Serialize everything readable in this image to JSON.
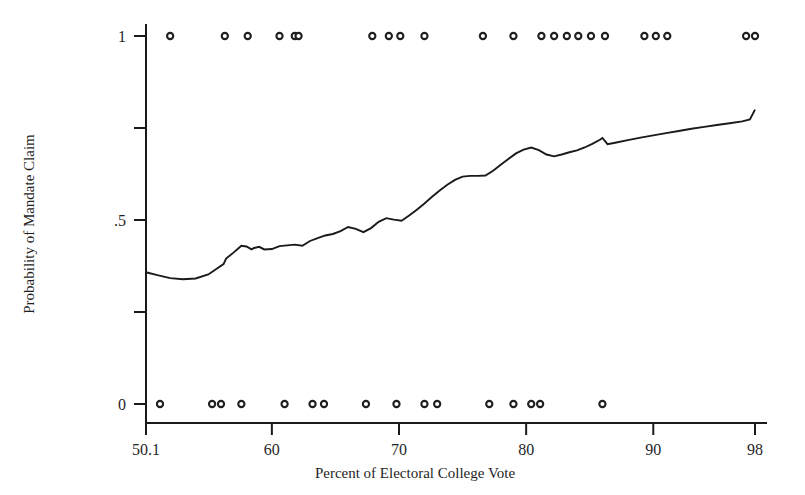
{
  "chart_data": {
    "type": "line",
    "title": "",
    "xlabel": "Percent of Electoral College Vote",
    "ylabel": "Probability of Mandate Claim",
    "xlim": [
      50.1,
      98
    ],
    "ylim": [
      0,
      1
    ],
    "grid": false,
    "legend": null,
    "x_ticks": [
      50.1,
      60,
      70,
      80,
      90,
      98
    ],
    "x_tick_labels": [
      "50.1",
      "60",
      "70",
      "80",
      "90",
      "98"
    ],
    "y_ticks": [
      0,
      0.25,
      0.5,
      0.75,
      1
    ],
    "y_tick_labels": [
      "0",
      "",
      ".5",
      "",
      "1"
    ],
    "series": [
      {
        "name": "Predicted probability of mandate claim",
        "type": "line",
        "x": [
          50.1,
          51.0,
          52.0,
          53.0,
          54.0,
          55.0,
          55.6,
          56.2,
          56.4,
          57.0,
          57.4,
          57.6,
          58.0,
          58.4,
          58.6,
          59.0,
          59.4,
          60.0,
          60.6,
          61.2,
          61.8,
          62.4,
          63.0,
          63.6,
          64.2,
          64.8,
          65.4,
          66.0,
          66.6,
          67.2,
          67.8,
          68.4,
          69.0,
          69.6,
          70.2,
          70.8,
          71.4,
          72.0,
          72.6,
          73.2,
          73.8,
          74.4,
          75.0,
          75.6,
          76.2,
          76.8,
          77.4,
          78.0,
          78.6,
          79.2,
          79.8,
          80.4,
          81.0,
          81.6,
          82.2,
          82.8,
          83.4,
          84.0,
          84.6,
          85.2,
          85.8,
          86.0,
          86.4,
          87.0,
          88.0,
          89.0,
          90.0,
          91.0,
          92.0,
          93.0,
          94.0,
          95.0,
          96.0,
          97.0,
          97.6,
          98.0
        ],
        "y": [
          0.358,
          0.35,
          0.342,
          0.339,
          0.341,
          0.352,
          0.366,
          0.38,
          0.395,
          0.412,
          0.424,
          0.43,
          0.428,
          0.42,
          0.424,
          0.427,
          0.42,
          0.421,
          0.429,
          0.431,
          0.433,
          0.43,
          0.443,
          0.451,
          0.458,
          0.462,
          0.47,
          0.481,
          0.476,
          0.467,
          0.478,
          0.495,
          0.505,
          0.501,
          0.498,
          0.512,
          0.528,
          0.545,
          0.563,
          0.58,
          0.596,
          0.609,
          0.618,
          0.62,
          0.62,
          0.621,
          0.634,
          0.65,
          0.666,
          0.681,
          0.691,
          0.697,
          0.69,
          0.678,
          0.673,
          0.678,
          0.684,
          0.689,
          0.697,
          0.707,
          0.718,
          0.723,
          0.706,
          0.71,
          0.717,
          0.724,
          0.73,
          0.736,
          0.742,
          0.748,
          0.753,
          0.758,
          0.763,
          0.768,
          0.773,
          0.8
        ]
      },
      {
        "name": "Observed outcomes: mandate claimed",
        "type": "scatter",
        "marker": "open-circle",
        "y_value": 1,
        "x": [
          52.0,
          56.3,
          58.1,
          60.6,
          61.8,
          62.1,
          67.9,
          69.2,
          70.1,
          72.0,
          76.6,
          79.0,
          81.2,
          82.2,
          83.2,
          84.1,
          85.1,
          86.2,
          89.3,
          90.2,
          91.1,
          97.3,
          98.0
        ]
      },
      {
        "name": "Observed outcomes: no mandate claimed",
        "type": "scatter",
        "marker": "open-circle",
        "y_value": 0,
        "x": [
          51.2,
          55.3,
          56.0,
          57.6,
          61.0,
          63.2,
          64.1,
          67.4,
          69.8,
          72.0,
          73.0,
          77.1,
          79.0,
          80.4,
          81.1,
          86.0
        ]
      }
    ]
  },
  "figure": {
    "background_color": "#ffffff",
    "line_color": "#1a1a1a",
    "marker_edge_color": "#1f1f1f",
    "marker_face_color": "#ffffff",
    "axis_color": "#1a1a1a"
  }
}
